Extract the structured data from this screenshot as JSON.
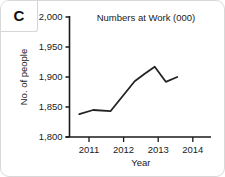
{
  "panel": {
    "label": "C"
  },
  "chart_data": {
    "type": "line",
    "title": "Numbers at Work (000)",
    "xlabel": "Year",
    "ylabel": "No. of people",
    "xlim": [
      2010.6,
      2014.6
    ],
    "ylim": [
      1800,
      2000
    ],
    "xticks": [
      2011,
      2012,
      2013,
      2014
    ],
    "xtick_labels": [
      "2011",
      "2012",
      "2013",
      "2014"
    ],
    "yticks": [
      1800,
      1850,
      1900,
      1950,
      2000
    ],
    "ytick_labels": [
      "1,800",
      "1,850",
      "1,900",
      "1,950",
      "2,000"
    ],
    "grid": false,
    "legend": false,
    "series": [
      {
        "name": "Numbers at Work",
        "x": [
          2010.72,
          2011.12,
          2011.62,
          2012.32,
          2012.6,
          2012.9,
          2013.22,
          2013.55
        ],
        "values": [
          1838,
          1845,
          1843,
          1893,
          1905,
          1917,
          1892,
          1900
        ]
      }
    ]
  }
}
